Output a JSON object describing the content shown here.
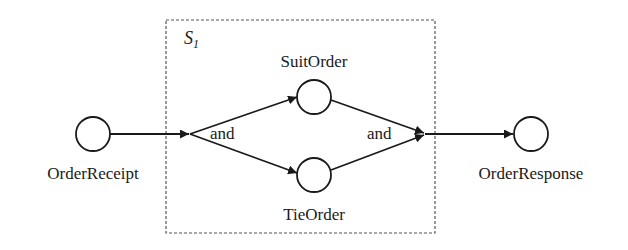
{
  "diagram": {
    "type": "workflow-petri-net",
    "scope": {
      "label": "S",
      "subscript": "1",
      "border_style": "dashed"
    },
    "nodes": [
      {
        "id": "order-receipt",
        "label": "OrderReceipt",
        "shape": "circle"
      },
      {
        "id": "suit-order",
        "label": "SuitOrder",
        "shape": "circle"
      },
      {
        "id": "tie-order",
        "label": "TieOrder",
        "shape": "circle"
      },
      {
        "id": "order-response",
        "label": "OrderResponse",
        "shape": "circle"
      }
    ],
    "gateways": [
      {
        "id": "and-split",
        "label": "and",
        "kind": "split"
      },
      {
        "id": "and-join",
        "label": "and",
        "kind": "join"
      }
    ],
    "edges": [
      {
        "from": "order-receipt",
        "to": "and-split"
      },
      {
        "from": "and-split",
        "to": "suit-order"
      },
      {
        "from": "and-split",
        "to": "tie-order"
      },
      {
        "from": "suit-order",
        "to": "and-join"
      },
      {
        "from": "tie-order",
        "to": "and-join"
      },
      {
        "from": "and-join",
        "to": "order-response"
      }
    ],
    "colors": {
      "stroke": "#1a1a1a",
      "background": "#ffffff",
      "box_border": "#555555"
    }
  }
}
